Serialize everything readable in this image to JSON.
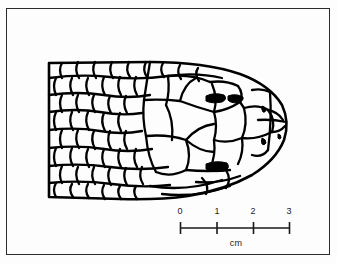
{
  "figure": {
    "type": "scientific-line-drawing",
    "background_color": "#fdfdfd",
    "ink_color": "#000000",
    "frame_color": "#2b2b2b"
  },
  "scale_bar": {
    "unit_label": "cm",
    "ticks": [
      {
        "label": "0",
        "value": 0
      },
      {
        "label": "1",
        "value": 1
      },
      {
        "label": "2",
        "value": 2
      },
      {
        "label": "3",
        "value": 3
      }
    ],
    "range_min": 0,
    "range_max": 3
  }
}
